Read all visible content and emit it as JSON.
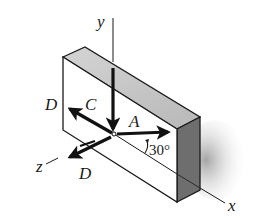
{
  "figure": {
    "axes": {
      "x_label": "x",
      "y_label": "y",
      "z_label": "z"
    },
    "forces": [
      {
        "label": "A",
        "direction": "along face, 30° above x-axis"
      },
      {
        "label": "B",
        "direction": "along face toward upper-left"
      },
      {
        "label": "C",
        "direction": "vertical, downward"
      },
      {
        "label": "D",
        "direction": "toward lower-left, along z"
      }
    ],
    "angle_label": "30°",
    "colors": {
      "line": "#1a1a1a",
      "top_face": "#c8c8c8",
      "side_face": "#6e6e6e",
      "shadow": "#b0b0b0"
    }
  }
}
